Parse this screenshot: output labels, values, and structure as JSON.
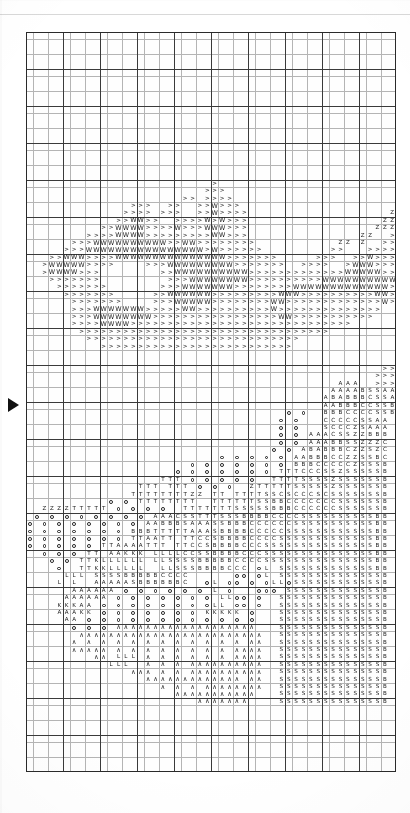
{
  "document": {
    "kind": "cross-stitch-pattern-chart",
    "title": "Cross Stitch Pattern Chart",
    "page_width": 410,
    "page_height": 813,
    "background_color": "#ffffff",
    "ink_color": "#1b1b1b"
  },
  "grid": {
    "left": 26,
    "top": 32,
    "cell_size": 7.4,
    "columns": 50,
    "rows": 100,
    "fine_line_color": "#b4b4b4",
    "heavy_line_color": "#3a3a3a",
    "heavy_line_every": 5,
    "border_color": "#2a2a2a"
  },
  "markers": [
    {
      "name": "row-marker-arrow",
      "shape": "right-triangle",
      "color": "#111111",
      "x": 8,
      "y": 398
    }
  ],
  "legend_symbols": [
    {
      "symbol": ">",
      "name": "greater-than"
    },
    {
      "symbol": "W",
      "name": "letter-w"
    },
    {
      "symbol": "Z",
      "name": "letter-z"
    },
    {
      "symbol": "A",
      "name": "letter-a"
    },
    {
      "symbol": "B",
      "name": "letter-b"
    },
    {
      "symbol": "C",
      "name": "letter-c"
    },
    {
      "symbol": "S",
      "name": "letter-s"
    },
    {
      "symbol": "T",
      "name": "letter-t"
    },
    {
      "symbol": "L",
      "name": "letter-l"
    },
    {
      "symbol": "K",
      "name": "letter-k"
    },
    {
      "symbol": "∧",
      "name": "caret"
    },
    {
      "symbol": "○",
      "name": "open-circle"
    },
    {
      "symbol": "•",
      "name": "filled-dot"
    },
    {
      "symbol": "▪",
      "name": "filled-square"
    },
    {
      "symbol": "=",
      "name": "equals"
    }
  ],
  "chart_data": {
    "type": "heatmap",
    "xlabel": "",
    "ylabel": "",
    "columns": 50,
    "rows": 100,
    "legend_position": "none",
    "grid": true,
    "rows_data": [
      "..................................................",
      "..................................................",
      "..................................................",
      "..................................................",
      "..................................................",
      "..................................................",
      "..................................................",
      "..................................................",
      "..................................................",
      "..................................................",
      "..................................................",
      "..................................................",
      "..................................................",
      "..................................................",
      "..................................................",
      "..................................................",
      "..................................................",
      "..................................................",
      "..................................................",
      "..................................................",
      ".........................>........................",
      "........................>>>.......................",
      ".....................>>.>>>>......................",
      "..............>>>..>>..>>W>>>.....................",
      ".............>>>>.>>>..>>W>>>>...................Z",
      "............>>WW>>..>>>>W>W>>>..................ZZ",
      "..........>>WWWW>>>>W>>>WWW>>>.................ZZZ",
      "........>>>>WWWW>>>>>>>>>WW>>>...............ZZ..>",
      "......>>>WWWWWWWWWW>>WW>>>>>>>>...........ZZ.Z..>>",
      ".....>>>WWWWWWWWWWWWWWWW>W>>>>>>.........>>...>>>>",
      "...>>WWW>>>>WWWWWWWWWWWWWWW>>>>>>>.....>>>..>>W>>>",
      "..>WWWWW>>>>....>>>WWWWWWWWW>>>>>>>..>>>>..>WWW>>>",
      "..>WWWW>>>........>>WWWWWWWWWW>>>>>>>>>>>>>WWWWW>>",
      "...>>>>>>>.........>>>WWWWWWWW>>>>>>>>>>WWWWWWWWWW",
      "....>>>>>>>.......>>>WWWWWWW>>>>>>>>WWWWWWWWWWWWW>",
      ".....>>>>>>>.....>>WWWWWW>>>>>>>>>WWW>>>>>>>>>>WW>",
      "......>>>>>>>....>>>WWWWW>>>>>>>>WW>>>>>>>>>>>>>W>",
      "......>>>WWWWWWW>>>>>WW>>>>>>>>>>W>>>>>>>>>>>>>>..",
      "......>>>WWWWWWWW>>>>>>>>>>>>>>>>>WW>>>>>>>>>>>...",
      "......>>>>WWWW>>>>>>>>>>>>>>>>>>>>>>>>>>>>>>.....",
      ".......>>>>>>>>>>>>>>>>>>>>>>>>>>>>>>>>>>........",
      "........>>>>>>>>>>>>>>>>>>>>>>>>>>>>>............",
      "..........>>>>>>>>>>>>>>>>>>>>>>>>>>..............",
      "..................................................",
      "..................................................",
      "................................................>>",
      "...............................................>>>",
      "..........................................AAA..>>>",
      ".........................................AAAABSSAA",
      "........................................ABABBBCSSA",
      "........................................AABBBCCSSB",
      "...................................o.o..BBBCCCCSSB",
      "..................................o.o...CCCCCSSAA",
      "..................................o.o...SCCCZSAAA",
      "..................................o.o.AAACSSZZBBB",
      "..................................o.o.AAABBSSZZZC",
      ".................................o.o.ABABBBCZZSZC",
      "..........................o.o.o.o.o.AABBBCCZZSSBC",
      "......................o.o.o.o.o.o.o.BBBCCCCCZSSSB",
      "....................o.o.o.o.o.o.o.TTTCCCSSZSSSSSB",
      "..................TTT.o.o.o.o.o..TTTTSSSSZSSSSSSB",
      "...............TTT.TTT.o.o.o..ZTTTTTSSSSSZSSSSSSB",
      "..............TTTTTTTTZZ.TT.TTTTSSCSCCCSCSSSSSSSB",
      "...........o.o.TTTTTTTT..TTTTTTSSBBCCCCCCCSSSSSSB",
      "..ZZZZTTTTT.o.o.o.o..TTTTTTTSSSSSBBBCCCCCCSSSSSSB",
      ".o.o.o.o.o.o.o.o.AAACSSTTTSSSBBBBCCCCSSSSSSSSSSBB",
      "o.o.o.o.o.o.o.o.AABBBSAAASSBBBCCCCCCSSSSSSSSSSSBB",
      "o.o.o.o.o.o.o.BBBTTTTTAAASBBBBCCCCCSSSSSSSSSSSSBB",
      "o.o.o.o.o.o.o.TTAATT.TTCCSBBBBCCCCSSSSSSSSSSSSSBB",
      "o.o.o.o.o.TTAAAATTT.TTCCSBBBBCCCSSSSSSSSSSSSSSSBB",
      "..o.o.o.TT.AAKKK.LLLLCCSSBBBBCCCSSSSSSSSSSSSSSSBB",
      "...o.o.TTKLLLLLL.LLSSSSBBBBBCCCCSSSSSSSSSSSSSSSBB",
      "....o..TTKKLLLLL..LLSSSBBBBCCC.oL.SSSSSSSSSSSSSBB",
      ".....LLL.SSSSBBBBBCCCC......oo.oL.SSSSSSSSSSSSSSB",
      "....L.L..AAAAASBBBBBBC..oL.oo.o.oLLoSSSSSSSSSSSSB",
      "......AAAAAA.o.o.o.o.o.o.L.o...ooo.SSSSSSSSSSSSSB",
      ".....AAAAAA.o.o.o.o.o.o.o.LLoo.o..SSSSSSSSSSSSSSB",
      "....KKKAA.o.o.o.o.o.o.o.oLL.oo.o..SSSSSSSSSSSSSSB",
      "....AAAKK.o.o.o.o.o.o.o.KKKKK.o...SSSSSSSSSSSSSSB",
      ".....AA.o.o.o.o.o.o.o.o.o.o.o.o...SSSSSSSSSSSSSSB",
      "......o.o.o.∧∧∧∧∧∧∧∧∧∧∧∧∧∧∧∧∧∧∧...SSSSSSSSSSSSSSB",
      ".......∧∧∧∧∧∧∧∧∧∧∧∧∧∧∧∧∧∧∧∧∧∧∧∧∧..SSSSSSSSSSSSSSB",
      "......∧.∧.∧.∧.∧.∧.∧.∧.∧.∧.∧.∧.∧∧..SSSSSSSSSSSSSSB",
      "......∧∧∧∧∧.∧.∧.∧.∧.∧.∧.∧.∧.∧∧∧∧..SSSSSSSSSSSSSSB",
      ".........∧∧.LLL.∧.∧.∧.∧.∧.∧.∧∧∧∧..SSSSSSSSSSSSSSB",
      "...........LLL..∧.∧.∧.∧∧∧∧∧∧∧∧∧∧..SSSSSSSSSSSSSSB",
      "..............∧∧∧.∧.∧.∧∧∧∧∧∧∧∧∧∧..SSSSSSSSSSSSSSB",
      "................∧∧∧∧∧∧∧∧∧∧∧∧∧.∧∧..SSSSSSSSSSSSSSB",
      "..................∧.∧.∧.∧∧∧∧∧∧∧∧..SSSSSSSSSSSSSSB",
      "....................∧∧∧∧∧∧∧∧∧∧∧...SSSSSSSSSSSSSSB",
      ".......................∧∧∧∧∧∧∧....SSSSSSSSSSSSSSB",
      "..................................................",
      "..................................................",
      "..................................................",
      "..................................................",
      "..................................................",
      "..................................................",
      "..................................................",
      "..................................................",
      "..................................................",
      "..................................................",
      "..................................................",
      ".................................................."
    ]
  }
}
